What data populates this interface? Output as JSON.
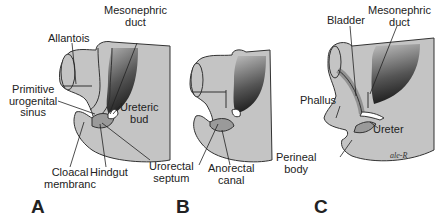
{
  "figure": {
    "panels": [
      {
        "letter": "A",
        "labels": {
          "allantois": "Allantois",
          "mesonephric_duct": "Mesonephric\nduct",
          "primitive_urogenital_sinus": "Primitive\nurogenital\nsinus",
          "ureteric_bud": "Ureteric\nbud",
          "cloacal_membrane": "Cloacal\nmembranc",
          "hindgut": "Hindgut",
          "urorectal_septum": "Urorectal\nseptum"
        }
      },
      {
        "letter": "B",
        "labels": {
          "anorectal_canal": "Anorectal\ncanal"
        }
      },
      {
        "letter": "C",
        "labels": {
          "bladder": "Bladder",
          "mesonephric_duct": "Mesonephric\nduct",
          "phallus": "Phallus",
          "ureter": "Ureter",
          "perineal_body": "Perineal\nbody",
          "signature": "ale-R"
        }
      }
    ],
    "colors": {
      "tissue": "#c4c4c4",
      "outline": "#333333",
      "dark_gradient": "#2e2e2e",
      "lumen": "#a8a8a8",
      "background": "#ffffff"
    }
  }
}
